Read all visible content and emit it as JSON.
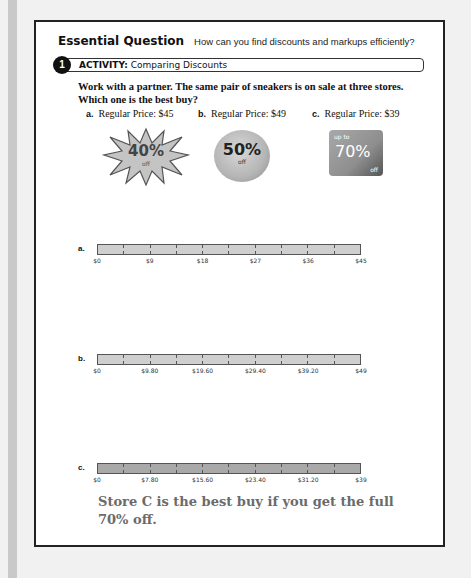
{
  "essential_question": {
    "title": "Essential Question",
    "text": "How can you find discounts and markups efficiently?"
  },
  "activity": {
    "number": "1",
    "label_bold": "ACTIVITY:",
    "label": "Comparing Discounts"
  },
  "prompt": "Work with a partner. The same pair of sneakers is on sale at three stores. Which one is the best buy?",
  "options": [
    {
      "letter": "a.",
      "label": "Regular Price: $45",
      "badge": {
        "shape": "starburst",
        "pre": "",
        "percent": "40%",
        "post": "off"
      }
    },
    {
      "letter": "b.",
      "label": "Regular Price: $49",
      "badge": {
        "shape": "circle",
        "pre": "",
        "percent": "50%",
        "post": "off"
      }
    },
    {
      "letter": "c.",
      "label": "Regular Price: $39",
      "badge": {
        "shape": "square",
        "pre": "up to",
        "percent": "70%",
        "post": "off"
      }
    }
  ],
  "bars": [
    {
      "letter": "a.",
      "segments": 10,
      "ticks": [
        "$0",
        "$9",
        "$18",
        "$27",
        "$36",
        "$45"
      ]
    },
    {
      "letter": "b.",
      "segments": 10,
      "ticks": [
        "$0",
        "$9.80",
        "$19.60",
        "$29.40",
        "$39.20",
        "$49"
      ]
    },
    {
      "letter": "c.",
      "segments": 10,
      "ticks": [
        "$0",
        "$7.80",
        "$15.60",
        "$23.40",
        "$31.20",
        "$39"
      ]
    }
  ],
  "answer": "Store C is the best buy if you get the full 70% off."
}
